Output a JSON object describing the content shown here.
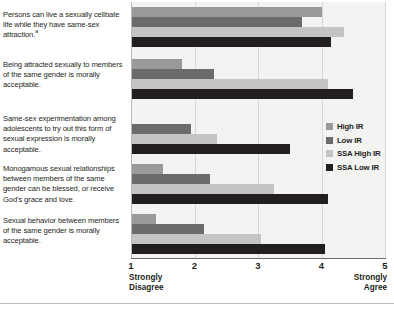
{
  "chart_data": {
    "type": "bar",
    "orientation": "horizontal",
    "title": "",
    "xlabel": "",
    "ylabel": "",
    "xlim": [
      1,
      5
    ],
    "xticks": [
      "1",
      "2",
      "3",
      "4",
      "5"
    ],
    "xtick_low_caption": "Strongly Disagree",
    "xtick_high_caption": "Strongly Agree",
    "grid": true,
    "legend_position": "right",
    "categories": [
      "Persons can live a sexually celibate life while they have same-sex attraction.",
      "Being attracted sexually to members of the same gender is morally acceptable.",
      "Same-sex experimentation among adolescents to try out this form of sexual expression is morally acceptable.",
      "Monogamous sexual relationships between members of the same gender can be blessed, or receive God's grace and love.",
      "Sexual behavior between members of the same gender is morally acceptable."
    ],
    "category_footnotes": [
      "a",
      "",
      "",
      "",
      ""
    ],
    "series": [
      {
        "name": "High IR",
        "color": "#9a9a98",
        "values": [
          4.0,
          1.8,
          1.02,
          1.5,
          1.4
        ]
      },
      {
        "name": "Low IR",
        "color": "#6b6b69",
        "values": [
          3.7,
          2.3,
          1.95,
          2.25,
          2.15
        ]
      },
      {
        "name": "SSA High IR",
        "color": "#c4c4c2",
        "values": [
          4.35,
          4.1,
          2.35,
          3.25,
          3.05
        ]
      },
      {
        "name": "SSA Low IR",
        "color": "#231f20",
        "values": [
          4.15,
          4.5,
          3.5,
          4.1,
          4.05
        ]
      }
    ]
  },
  "legend": {
    "items": [
      {
        "label": "High IR"
      },
      {
        "label": "Low IR"
      },
      {
        "label": "SSA High IR"
      },
      {
        "label": "SSA Low IR"
      }
    ]
  }
}
